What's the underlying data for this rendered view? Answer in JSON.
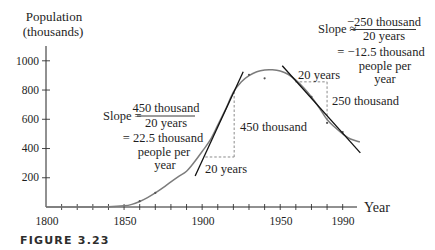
{
  "figure": {
    "caption": "FIGURE 3.23",
    "y_axis_title_line1": "Population",
    "y_axis_title_line2": "(thousands)",
    "x_axis_title": "Year",
    "x_tick_labels": [
      "1800",
      "1850",
      "1900",
      "1950",
      "1990"
    ],
    "y_tick_labels": [
      "1000",
      "800",
      "600",
      "400",
      "200"
    ],
    "left_annotation": {
      "slope_prefix": "Slope =",
      "numerator": "450 thousand",
      "denominator": "20 years",
      "result_line1": "= 22.5 thousand",
      "result_line2": "people per",
      "result_line3": "year",
      "rise_label": "450 thousand",
      "run_label": "20 years"
    },
    "right_annotation": {
      "slope_prefix": "Slope ≈",
      "numerator": "−250 thousand",
      "denominator": "20 years",
      "result_line1": "= −12.5 thousand",
      "result_line2": "people per",
      "result_line3": "year",
      "rise_label": "250 thousand",
      "run_label": "20 years"
    },
    "colors": {
      "curve": "#7c7c7c",
      "tangent": "#111111",
      "dashed": "#8a8a8a",
      "text": "#1e1e1e"
    }
  },
  "chart_data": {
    "type": "line",
    "title": "",
    "caption": "FIGURE 3.23",
    "xlabel": "Year",
    "ylabel": "Population (thousands)",
    "xlim": [
      1800,
      2001
    ],
    "ylim": [
      0,
      1100
    ],
    "grid": false,
    "x_ticks": [
      1800,
      1810,
      1820,
      1830,
      1840,
      1850,
      1860,
      1870,
      1880,
      1890,
      1900,
      1910,
      1920,
      1930,
      1940,
      1950,
      1960,
      1970,
      1980,
      1990
    ],
    "x_tick_labels": [
      1800,
      1850,
      1900,
      1950,
      1990
    ],
    "y_ticks": [
      200,
      400,
      600,
      800,
      1000
    ],
    "series": [
      {
        "name": "Population curve (fitted)",
        "x": [
          1800,
          1820,
          1840,
          1850,
          1855,
          1860,
          1865,
          1870,
          1875,
          1880,
          1885,
          1890,
          1895,
          1900,
          1905,
          1910,
          1915,
          1920,
          1925,
          1930,
          1935,
          1940,
          1945,
          1950,
          1955,
          1960,
          1965,
          1970,
          1975,
          1980,
          1985,
          1990,
          1995,
          2001
        ],
        "y": [
          0,
          0,
          2,
          8,
          18,
          38,
          64,
          96,
          132,
          172,
          210,
          245,
          308,
          380,
          455,
          560,
          668,
          785,
          855,
          898,
          925,
          937,
          938,
          930,
          908,
          868,
          815,
          752,
          678,
          598,
          545,
          500,
          465,
          445
        ]
      }
    ],
    "data_points": {
      "x": [
        1860,
        1870,
        1930,
        1940,
        1970,
        1980,
        1990
      ],
      "y": [
        40,
        96,
        904,
        880,
        753,
        575,
        513
      ]
    },
    "tangent_lines": [
      {
        "at_year": 1920,
        "slope": 22.5,
        "slope_units": "thousand people per year",
        "from": [
          1895.5,
          212
        ],
        "to": [
          1926.3,
          925
        ],
        "run_segment": {
          "from": [
            1902,
            342
          ],
          "to": [
            1920.5,
            342
          ],
          "label": "20 years"
        },
        "rise_segment": {
          "from": [
            1920.5,
            342
          ],
          "to": [
            1920.5,
            795
          ],
          "label": "450 thousand"
        }
      },
      {
        "at_year": 1980,
        "slope": -12.5,
        "slope_units": "thousand people per year",
        "from": [
          1951.3,
          966
        ],
        "to": [
          2001.3,
          370
        ],
        "run_segment": {
          "from": [
            1959.6,
            856
          ],
          "to": [
            1980,
            856
          ],
          "label": "20 years"
        },
        "rise_segment": {
          "from": [
            1980,
            856
          ],
          "to": [
            1980,
            582
          ],
          "label": "250 thousand"
        }
      }
    ],
    "annotations": [
      "Slope = 450 thousand / 20 years = 22.5 thousand people per year",
      "Slope ≈ −250 thousand / 20 years = −12.5 thousand people per year"
    ]
  }
}
